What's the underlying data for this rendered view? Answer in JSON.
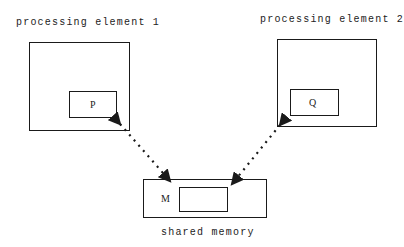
{
  "diagram": {
    "pe1": {
      "label": "processing element 1",
      "inner_label": "P"
    },
    "pe2": {
      "label": "processing element 2",
      "inner_label": "Q"
    },
    "memory": {
      "label": "shared memory",
      "inner_label": "M"
    },
    "edges": [
      {
        "from": "memory",
        "to": "pe1",
        "style": "dotted-arrow"
      },
      {
        "from": "memory",
        "to": "pe2",
        "style": "dotted-arrow"
      }
    ]
  }
}
